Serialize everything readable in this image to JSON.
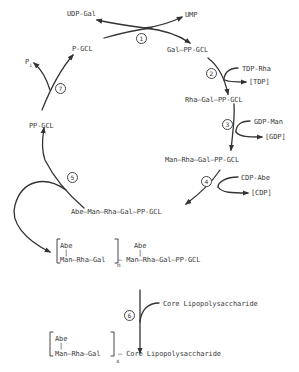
{
  "diagram": {
    "title": "",
    "nodes": {
      "udp_gal": "UDP-Gal",
      "ump": "UMP",
      "gal_pp_gcl": "Gal—PP-GCL",
      "tdp_rha": "TDP-Rha",
      "tdp": "[TDP]",
      "rha_gal_pp_gcl": "Rha—Gal—PP-GCL",
      "gdp_man": "GDP-Man",
      "gdp": "[GDP]",
      "man_rha_gal_pp_gcl": "Man—Rha—Gal—PP-GCL",
      "cdp_abe": "CDP-Abe",
      "cdp": "[CDP]",
      "abe_man_rha_gal_pp_gcl": "Abe—Man—Rha—Gal—PP-GCL",
      "pp_gcl": "PP-GCL",
      "p_gcl": "P-GCL",
      "pi": "P",
      "pi_sub": "i",
      "polymer_abe": "Abe",
      "polymer_bar": "|",
      "polymer_chain": "Man—Rha—Gal",
      "polymer_n": "n",
      "polymer_tail_abe": "Abe",
      "polymer_tail_bar": "|",
      "polymer_tail_chain": "— Man—Rha—Gal—PP-GCL",
      "core_lps_in": "Core Lipopolysaccharide",
      "final_abe": "Abe",
      "final_bar": "|",
      "final_chain": "Man—Rha—Gal",
      "final_x": "x",
      "final_core": "— Core Lipopolysaccharide"
    },
    "steps": [
      "1",
      "2",
      "3",
      "4",
      "5",
      "6",
      "7"
    ],
    "colors": {
      "line": "#333333",
      "text": "#3a3a3a",
      "background": "#ffffff"
    }
  }
}
